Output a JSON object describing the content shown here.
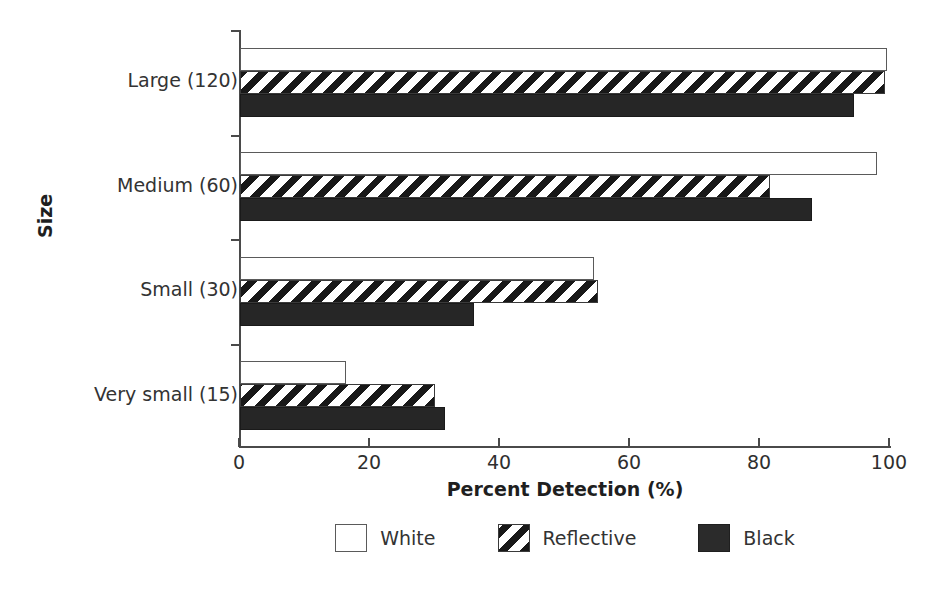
{
  "chart_data": {
    "type": "bar",
    "orientation": "horizontal",
    "title": "",
    "xlabel": "Percent Detection (%)",
    "ylabel": "Size",
    "xlim": [
      0,
      100
    ],
    "xticks": [
      0,
      20,
      40,
      60,
      80,
      100
    ],
    "xtick_labels": [
      "0",
      "20",
      "40",
      "60",
      "80",
      "100"
    ],
    "grid": false,
    "legend_position": "bottom",
    "categories": [
      "Large (120)",
      "Medium (60)",
      "Small (30)",
      "Very small (15)"
    ],
    "series": [
      {
        "name": "White",
        "fill": "white-outline",
        "values": [
          99.5,
          98.0,
          54.5,
          16.3
        ]
      },
      {
        "name": "Reflective",
        "fill": "diagonal-hatch",
        "values": [
          99.3,
          81.5,
          55.0,
          30.0
        ]
      },
      {
        "name": "Black",
        "fill": "solid-black",
        "values": [
          94.5,
          88.0,
          36.0,
          31.5
        ]
      }
    ]
  },
  "axes": {
    "x_title": "Percent Detection (%)",
    "y_title": "Size"
  },
  "legend": {
    "items": [
      {
        "label": "White",
        "swatch": "white"
      },
      {
        "label": "Reflective",
        "swatch": "reflective"
      },
      {
        "label": "Black",
        "swatch": "black"
      }
    ]
  },
  "colors": {
    "axis": "#4a4a4a",
    "text": "#2b2b2b",
    "bar_outline": "#5a5a5a",
    "black_bar": "#262626",
    "background": "#ffffff"
  }
}
